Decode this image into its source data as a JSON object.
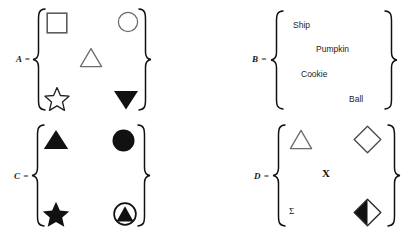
{
  "figure": {
    "title": ""
  },
  "sets": [
    {
      "id": "A",
      "label": "A =",
      "elements": [
        {
          "name": "hollow-square",
          "kind": "shape",
          "fill": "none"
        },
        {
          "name": "hollow-circle",
          "kind": "shape",
          "fill": "none"
        },
        {
          "name": "hollow-triangle",
          "kind": "shape",
          "fill": "none"
        },
        {
          "name": "hollow-star",
          "kind": "shape",
          "fill": "none"
        },
        {
          "name": "filled-down-triangle",
          "kind": "shape",
          "fill": "solid"
        }
      ]
    },
    {
      "id": "B",
      "label": "B =",
      "elements": [
        {
          "name": "word-ship",
          "kind": "word",
          "text": "Ship"
        },
        {
          "name": "word-pumpkin",
          "kind": "word",
          "text": "Pumpkin"
        },
        {
          "name": "word-cookie",
          "kind": "word",
          "text": "Cookie"
        },
        {
          "name": "word-ball",
          "kind": "word",
          "text": "Ball"
        }
      ]
    },
    {
      "id": "C",
      "label": "C =",
      "elements": [
        {
          "name": "filled-triangle",
          "kind": "shape",
          "fill": "solid"
        },
        {
          "name": "filled-circle",
          "kind": "shape",
          "fill": "solid"
        },
        {
          "name": "filled-star",
          "kind": "shape",
          "fill": "solid"
        },
        {
          "name": "circled-filled-triangle",
          "kind": "shape",
          "fill": "mixed"
        }
      ]
    },
    {
      "id": "D",
      "label": "D =",
      "elements": [
        {
          "name": "hollow-triangle",
          "kind": "shape",
          "fill": "none"
        },
        {
          "name": "hollow-diamond",
          "kind": "shape",
          "fill": "none"
        },
        {
          "name": "letter-x",
          "kind": "glyph",
          "text": "X"
        },
        {
          "name": "greek-sigma",
          "kind": "glyph",
          "text": "Σ"
        },
        {
          "name": "half-filled-diamond",
          "kind": "shape",
          "fill": "half"
        }
      ]
    }
  ],
  "words": {
    "ship": "Ship",
    "pumpkin": "Pumpkin",
    "cookie": "Cookie",
    "ball": "Ball"
  },
  "glyphs": {
    "x": "X",
    "sigma": "Σ"
  },
  "labels": {
    "a": "A =",
    "b": "B =",
    "c": "C =",
    "d": "D ="
  },
  "colors": {
    "background": "#ffffff",
    "ink": "#111111",
    "outline_gray": "#6b6b6b",
    "text": "#1c1c1c"
  }
}
